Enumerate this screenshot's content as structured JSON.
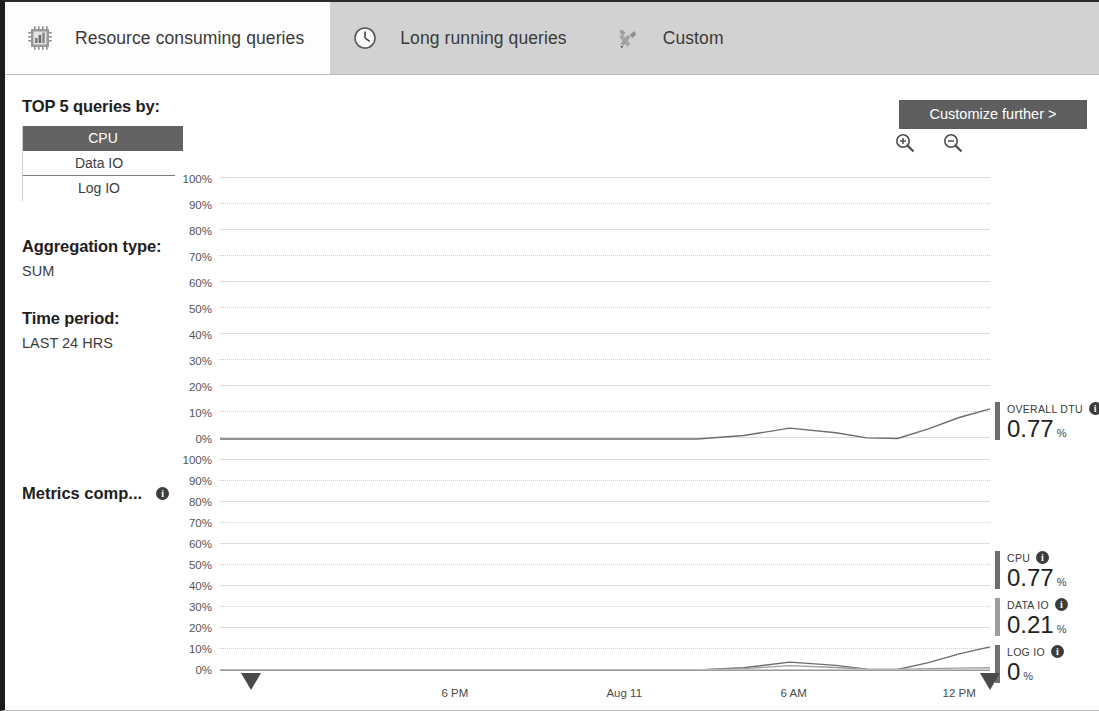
{
  "tabs": [
    {
      "label": "Resource consuming queries",
      "icon": "chip-chart-icon",
      "active": true
    },
    {
      "label": "Long running queries",
      "icon": "clock-icon",
      "active": false
    },
    {
      "label": "Custom",
      "icon": "tools-icon",
      "active": false
    }
  ],
  "sidebar": {
    "top_queries_heading": "TOP 5 queries by:",
    "metric_options": [
      {
        "label": "CPU",
        "selected": true
      },
      {
        "label": "Data IO",
        "selected": false
      },
      {
        "label": "Log IO",
        "selected": false
      }
    ],
    "aggregation_heading": "Aggregation type:",
    "aggregation_value": "SUM",
    "time_period_heading": "Time period:",
    "time_period_value": "LAST 24 HRS",
    "metrics_comparison_label": "Metrics comp...",
    "info_glyph": "i"
  },
  "toolbar": {
    "customize_label": "Customize further >",
    "zoom_in_icon": "zoom-in-icon",
    "zoom_out_icon": "zoom-out-icon"
  },
  "chart_data": [
    {
      "type": "line",
      "title": "Overall DTU",
      "ylabel": "",
      "xlabel": "",
      "ylim": [
        0,
        100
      ],
      "grid": true,
      "yticks": [
        "100%",
        "90%",
        "80%",
        "70%",
        "60%",
        "50%",
        "40%",
        "30%",
        "20%",
        "10%",
        "0%"
      ],
      "xticks": [
        "6 PM",
        "Aug 11",
        "6 AM",
        "12 PM"
      ],
      "series": [
        {
          "name": "OVERALL DTU",
          "color": "#6d6d6d",
          "x": [
            0,
            56,
            62,
            68,
            74,
            80,
            84,
            88,
            92,
            96,
            100
          ],
          "values": [
            0,
            0,
            0,
            1.2,
            3.8,
            2.2,
            0.4,
            0.2,
            3.5,
            7.5,
            10.5
          ]
        }
      ],
      "legend": [
        {
          "name": "OVERALL DTU",
          "value": "0.77",
          "unit": "%",
          "color": "#6d6d6d"
        }
      ],
      "legend_position": "right"
    },
    {
      "type": "line",
      "title": "Metrics comparison",
      "ylabel": "",
      "xlabel": "",
      "ylim": [
        0,
        100
      ],
      "grid": true,
      "yticks": [
        "100%",
        "90%",
        "80%",
        "70%",
        "60%",
        "50%",
        "40%",
        "30%",
        "20%",
        "10%",
        "0%"
      ],
      "xticks": [
        "6 PM",
        "Aug 11",
        "6 AM",
        "12 PM"
      ],
      "series": [
        {
          "name": "CPU",
          "color": "#6d6d6d",
          "x": [
            0,
            56,
            62,
            68,
            74,
            80,
            84,
            88,
            92,
            96,
            100
          ],
          "values": [
            0,
            0,
            0,
            1.0,
            3.4,
            2.0,
            0.4,
            0.2,
            3.2,
            7.0,
            10.0
          ]
        },
        {
          "name": "DATA IO",
          "color": "#9e9e9e",
          "x": [
            0,
            56,
            62,
            68,
            74,
            80,
            84,
            88,
            92,
            96,
            100
          ],
          "values": [
            0,
            0,
            0,
            0.6,
            1.9,
            1.1,
            0.3,
            0.2,
            0.6,
            0.8,
            1.0
          ]
        },
        {
          "name": "LOG IO",
          "color": "#c4c4c4",
          "x": [
            0,
            100
          ],
          "values": [
            0,
            0
          ]
        }
      ],
      "legend": [
        {
          "name": "CPU",
          "value": "0.77",
          "unit": "%",
          "color": "#6d6d6d"
        },
        {
          "name": "DATA IO",
          "value": "0.21",
          "unit": "%",
          "color": "#9e9e9e"
        },
        {
          "name": "LOG IO",
          "value": "0",
          "unit": "%",
          "color": "#707070"
        }
      ],
      "legend_position": "right"
    }
  ],
  "xaxis": {
    "ticks": [
      {
        "label": "6 PM",
        "pos": 30.5
      },
      {
        "label": "Aug 11",
        "pos": 52.5
      },
      {
        "label": "6 AM",
        "pos": 74.5
      },
      {
        "label": "12 PM",
        "pos": 96.0
      }
    ],
    "range_handle_left": 4.0,
    "range_handle_right": 100.0
  },
  "colors": {
    "tabbar_bg": "#d2d2d2",
    "active_tab_bg": "#fdfdfd",
    "selected_option_bg": "#636363",
    "button_bg": "#5e5e5e",
    "grid": "#dcdcdc"
  }
}
